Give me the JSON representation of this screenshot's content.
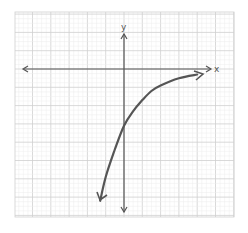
{
  "chart_data": {
    "type": "line",
    "title": "",
    "xlabel": "x",
    "ylabel": "y",
    "grid": true,
    "legend": null,
    "xlim": [
      -6,
      6
    ],
    "ylim": [
      -8,
      3
    ],
    "series": [
      {
        "name": "curve",
        "color": "#555555",
        "points": [
          {
            "x": -1.3,
            "y": -7.2
          },
          {
            "x": -1.0,
            "y": -5.9
          },
          {
            "x": -0.5,
            "y": -4.4
          },
          {
            "x": 0.0,
            "y": -3.1
          },
          {
            "x": 0.5,
            "y": -2.3
          },
          {
            "x": 1.0,
            "y": -1.7
          },
          {
            "x": 1.5,
            "y": -1.2
          },
          {
            "x": 2.0,
            "y": -0.9
          },
          {
            "x": 3.0,
            "y": -0.5
          },
          {
            "x": 4.0,
            "y": -0.3
          }
        ]
      }
    ]
  },
  "axes": {
    "x_label": "x",
    "y_label": "y"
  },
  "colors": {
    "minor_grid": "#ececec",
    "major_grid": "#cfcfcf",
    "axis": "#555555",
    "curve": "#555555"
  }
}
